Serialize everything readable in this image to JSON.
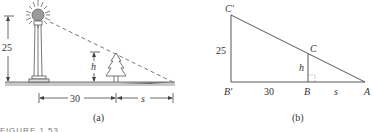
{
  "panel_a": {
    "caption": "(a)",
    "lamp_height_label": "25",
    "tree_height_label": "h",
    "distance_label": "30",
    "shadow_label": "s"
  },
  "panel_b": {
    "caption": "(b)",
    "vertices": {
      "c_prime": "C′",
      "b_prime": "B′",
      "c": "C",
      "b": "B",
      "a": "A"
    },
    "side_c_prime_b_prime": "25",
    "side_cb": "h",
    "side_b_prime_b": "30",
    "side_ba": "s"
  },
  "figure_caption": "FIGURE 1.53",
  "colors": {
    "line": "#444444",
    "ground": "#9a9a9a",
    "text": "#333333",
    "sun": "#888888"
  }
}
